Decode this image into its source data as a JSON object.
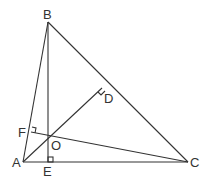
{
  "diagram": {
    "type": "geometry-triangle",
    "stroke_color": "#333333",
    "points": {
      "A": {
        "label": "A",
        "x": 23,
        "y": 162
      },
      "B": {
        "label": "B",
        "x": 48,
        "y": 22
      },
      "C": {
        "label": "C",
        "x": 188,
        "y": 162
      },
      "D": {
        "label": "D",
        "x": 102,
        "y": 88
      },
      "E": {
        "label": "E",
        "x": 48,
        "y": 162
      },
      "F": {
        "label": "F",
        "x": 31,
        "y": 132
      },
      "O": {
        "label": "O",
        "x": 48,
        "y": 138
      }
    },
    "segments": [
      "AB",
      "BC",
      "CA",
      "BE",
      "AD",
      "CF"
    ],
    "right_angles": [
      "D",
      "E",
      "F"
    ]
  }
}
